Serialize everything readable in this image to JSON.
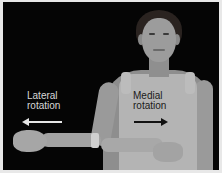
{
  "image": {
    "description": "Grayscale photo of a woman demonstrating shoulder rotation: left arm extended outward, right arm bent across abdomen",
    "colors": {
      "background": "#050505",
      "frame": "#e8e8e8",
      "lateral_label": "#d8d8d8",
      "medial_label": "#1a1a1a"
    }
  },
  "annotations": {
    "lateral": {
      "line1": "Lateral",
      "line2": "rotation",
      "arrow_direction": "left",
      "arrow_icon": "arrow-left-icon"
    },
    "medial": {
      "line1": "Medial",
      "line2": "rotation",
      "arrow_direction": "right",
      "arrow_icon": "arrow-right-icon"
    }
  }
}
